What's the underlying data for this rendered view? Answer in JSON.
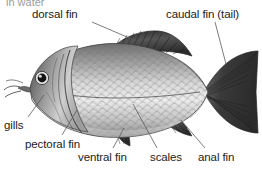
{
  "figure": {
    "clipped_header_text": "in water",
    "background_color": "#ffffff",
    "text_color": "#1c1c1c",
    "leader_line_color": "#5a5a5a",
    "body_light": "#e8e8e8",
    "body_mid": "#a8a8a8",
    "body_dark": "#4f4f4f",
    "fin_dark": "#3a3a3a"
  },
  "labels": {
    "dorsal_fin": "dorsal fin",
    "caudal_fin": "caudal fin (tail)",
    "gills": "gills",
    "pectoral_fin": "pectoral fin",
    "ventral_fin": "ventral fin",
    "scales": "scales",
    "anal_fin": "anal fin"
  },
  "parts": [
    {
      "id": "dorsal-fin",
      "label": "dorsal fin",
      "label_x": 32,
      "label_y": 8,
      "leader_from_x": 92,
      "leader_from_y": 22,
      "leader_to_x": 134,
      "leader_to_y": 40
    },
    {
      "id": "caudal-fin",
      "label": "caudal fin (tail)",
      "label_x": 166,
      "label_y": 8,
      "leader_from_x": 215,
      "leader_from_y": 22,
      "leader_to_x": 226,
      "leader_to_y": 64
    },
    {
      "id": "gills",
      "label": "gills",
      "label_x": 4,
      "label_y": 119,
      "leader_from_x": 28,
      "leader_from_y": 117,
      "leader_to_x": 42,
      "leader_to_y": 96
    },
    {
      "id": "pectoral-fin",
      "label": "pectoral fin",
      "label_x": 25,
      "label_y": 138,
      "leader_from_x": 62,
      "leader_from_y": 135,
      "leader_to_x": 77,
      "leader_to_y": 110
    },
    {
      "id": "ventral-fin",
      "label": "ventral fin",
      "label_x": 78,
      "label_y": 151,
      "leader_from_x": 113,
      "leader_from_y": 148,
      "leader_to_x": 124,
      "leader_to_y": 128
    },
    {
      "id": "scales",
      "label": "scales",
      "label_x": 150,
      "label_y": 151,
      "leader_from_x": 157,
      "leader_from_y": 148,
      "leader_to_x": 133,
      "leader_to_y": 104
    },
    {
      "id": "anal-fin",
      "label": "anal fin",
      "label_x": 198,
      "label_y": 151,
      "leader_from_x": 205,
      "leader_from_y": 148,
      "leader_to_x": 181,
      "leader_to_y": 120
    }
  ]
}
